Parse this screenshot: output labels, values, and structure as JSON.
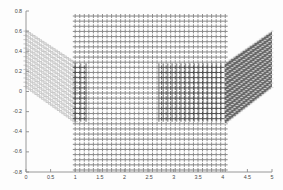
{
  "chart_data": {
    "type": "scatter",
    "title": "",
    "xlabel": "",
    "ylabel": "",
    "xlim": [
      0,
      5
    ],
    "ylim": [
      -0.8,
      0.8
    ],
    "grid": false,
    "legend": null,
    "xticks": [
      "0",
      "0.5",
      "1",
      "1.5",
      "2",
      "2.5",
      "3",
      "3.5",
      "4",
      "4.5",
      "5"
    ],
    "xtick_values": [
      0,
      0.5,
      1,
      1.5,
      2,
      2.5,
      3,
      3.5,
      4,
      4.5,
      5
    ],
    "yticks": [
      "0.8",
      "0.6",
      "0.4",
      "0.2",
      "0",
      "-0.2",
      "-0.4",
      "-0.6",
      "-0.8"
    ],
    "ytick_values": [
      0.8,
      0.6,
      0.4,
      0.2,
      0,
      -0.2,
      -0.4,
      -0.6,
      -0.8
    ],
    "regions": [
      {
        "name": "left-fan",
        "shade": "#c9c9c9",
        "x_range": [
          0.0,
          1.0
        ],
        "y_top": [
          0.6,
          0.28
        ],
        "y_bottom": [
          0.05,
          -0.3
        ],
        "rows": 13,
        "cols": 22
      },
      {
        "name": "center-grid",
        "shade": "#8a8a8a",
        "x_range": [
          1.0,
          4.05
        ],
        "y_range": [
          -0.78,
          0.75
        ],
        "rows": 30,
        "cols": 33,
        "dark_bands_x": [
          [
            1.0,
            1.22
          ],
          [
            2.7,
            4.05
          ]
        ],
        "dark_band_y": [
          -0.3,
          0.28
        ]
      },
      {
        "name": "right-fan",
        "shade": "#595959",
        "x_range": [
          4.05,
          5.0
        ],
        "y_top": [
          0.28,
          0.6
        ],
        "y_bottom": [
          -0.32,
          0.04
        ],
        "rows": 13,
        "cols": 20
      }
    ],
    "colors": {
      "axis": "#8c8c8c",
      "tick_text": "#4a4a4a",
      "background": "#fdfdfd",
      "light_marker": "#c9c9c9",
      "mid_marker": "#8a8a8a",
      "dark_marker": "#4f4f4f"
    }
  },
  "axes": {
    "y_ticks": [
      "0.8",
      "0.6",
      "0.4",
      "0.2",
      "0",
      "-0.2",
      "-0.4",
      "-0.6",
      "-0.8"
    ],
    "x_ticks": [
      "0",
      "0.5",
      "1",
      "1.5",
      "2",
      "2.5",
      "3",
      "3.5",
      "4",
      "4.5",
      "5"
    ]
  }
}
